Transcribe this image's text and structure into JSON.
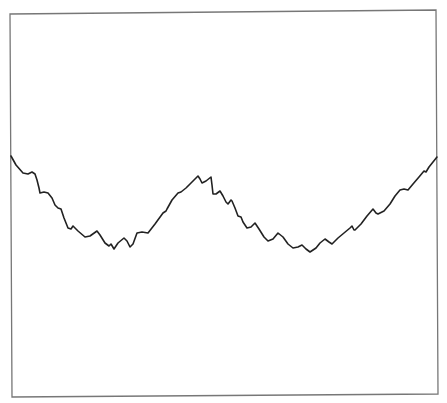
{
  "chart_data": {
    "type": "line",
    "title": "",
    "xlabel": "",
    "ylabel": "",
    "grid": false,
    "legend": null,
    "axis_ticks": "none",
    "frame": {
      "corners": [
        [
          10,
          14
        ],
        [
          436,
          10
        ],
        [
          438,
          394
        ],
        [
          12,
          397
        ]
      ],
      "stroke": "#777777"
    },
    "series": [
      {
        "name": "signal",
        "color": "#222222",
        "points_px": [
          [
            11,
            156
          ],
          [
            16,
            165
          ],
          [
            23,
            173
          ],
          [
            28,
            174
          ],
          [
            32,
            172
          ],
          [
            35,
            174
          ],
          [
            37,
            180
          ],
          [
            39,
            188
          ],
          [
            40,
            193
          ],
          [
            44,
            192
          ],
          [
            48,
            193
          ],
          [
            52,
            198
          ],
          [
            55,
            205
          ],
          [
            58,
            208
          ],
          [
            61,
            209
          ],
          [
            64,
            218
          ],
          [
            68,
            228
          ],
          [
            71,
            229
          ],
          [
            73,
            226
          ],
          [
            78,
            231
          ],
          [
            85,
            237
          ],
          [
            90,
            236
          ],
          [
            97,
            231
          ],
          [
            100,
            235
          ],
          [
            105,
            243
          ],
          [
            109,
            246
          ],
          [
            111,
            244
          ],
          [
            114,
            249
          ],
          [
            118,
            243
          ],
          [
            124,
            238
          ],
          [
            127,
            241
          ],
          [
            130,
            247
          ],
          [
            133,
            244
          ],
          [
            137,
            233
          ],
          [
            142,
            232
          ],
          [
            148,
            233
          ],
          [
            155,
            224
          ],
          [
            163,
            213
          ],
          [
            166,
            211
          ],
          [
            167,
            209
          ],
          [
            172,
            200
          ],
          [
            178,
            193
          ],
          [
            181,
            192
          ],
          [
            186,
            188
          ],
          [
            192,
            182
          ],
          [
            198,
            176
          ],
          [
            200,
            179
          ],
          [
            202,
            183
          ],
          [
            206,
            181
          ],
          [
            211,
            177
          ],
          [
            212,
            185
          ],
          [
            213,
            194
          ],
          [
            216,
            194
          ],
          [
            220,
            191
          ],
          [
            223,
            196
          ],
          [
            226,
            202
          ],
          [
            228,
            204
          ],
          [
            231,
            200
          ],
          [
            232,
            201
          ],
          [
            235,
            208
          ],
          [
            238,
            216
          ],
          [
            241,
            217
          ],
          [
            243,
            222
          ],
          [
            247,
            228
          ],
          [
            251,
            227
          ],
          [
            255,
            223
          ],
          [
            259,
            229
          ],
          [
            264,
            237
          ],
          [
            268,
            241
          ],
          [
            273,
            239
          ],
          [
            278,
            233
          ],
          [
            283,
            237
          ],
          [
            288,
            244
          ],
          [
            293,
            248
          ],
          [
            298,
            247
          ],
          [
            302,
            245
          ],
          [
            306,
            249
          ],
          [
            310,
            252
          ],
          [
            316,
            248
          ],
          [
            320,
            243
          ],
          [
            325,
            239
          ],
          [
            329,
            242
          ],
          [
            332,
            244
          ],
          [
            338,
            238
          ],
          [
            344,
            233
          ],
          [
            350,
            228
          ],
          [
            352,
            226
          ],
          [
            354,
            230
          ],
          [
            355,
            230
          ],
          [
            361,
            224
          ],
          [
            367,
            216
          ],
          [
            373,
            209
          ],
          [
            376,
            213
          ],
          [
            378,
            214
          ],
          [
            384,
            211
          ],
          [
            390,
            204
          ],
          [
            395,
            196
          ],
          [
            400,
            190
          ],
          [
            404,
            189
          ],
          [
            408,
            190
          ],
          [
            413,
            184
          ],
          [
            419,
            177
          ],
          [
            424,
            171
          ],
          [
            426,
            172
          ],
          [
            429,
            167
          ],
          [
            433,
            162
          ],
          [
            437,
            157
          ]
        ]
      }
    ]
  }
}
